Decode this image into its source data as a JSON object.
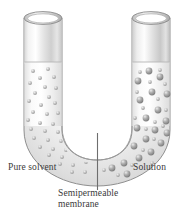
{
  "figure": {
    "type": "osmosis-u-tube-diagram",
    "labels": {
      "left": "Pure solvent",
      "right": "Solution",
      "membrane_line1": "Semipermeable",
      "membrane_line2": "membrane"
    },
    "colors": {
      "glass_light": "#fdfdfd",
      "glass_mid": "#e9e9e9",
      "glass_shadow": "#bfbfbf",
      "outline": "#8d8d8d",
      "liquid": "#f4f4f4",
      "solvent_particle": "#b9b9b9",
      "solute_particle": "#9a9a9a",
      "membrane": "#6e6e6e",
      "text": "#3a3a3a"
    },
    "parts": {
      "left_tube": "Pure solvent arm containing only small solvent particles",
      "right_tube": "Solution arm containing small solvent particles and large solute spheres",
      "u_bend": "Curved connecting channel at the bottom",
      "membrane": "Vertical line at the bottom centre separating the two arms",
      "liquid_level_left_y": 62,
      "liquid_level_right_y": 62
    },
    "particles": {
      "solvent_count": 46,
      "solute_count": 22,
      "solvent_radius": 2.0,
      "solute_radius": 3.4
    }
  }
}
